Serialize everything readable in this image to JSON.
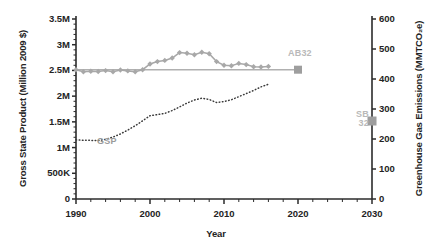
{
  "chart_data": {
    "type": "line",
    "title": "",
    "xlabel": "Year",
    "xlim": [
      1990,
      2030
    ],
    "xticks": [
      1990,
      2000,
      2010,
      2020,
      2030
    ],
    "xtick_labels": [
      "1990",
      "2000",
      "2010",
      "2020",
      "2030"
    ],
    "minor_xtick_step": 2,
    "grid": false,
    "legend_position": "inline-annotations",
    "axes": [
      {
        "id": "left",
        "ylabel": "Gross State Product (Million 2009 $)",
        "ylim": [
          0,
          3500000
        ],
        "yticks": [
          0,
          500000,
          1000000,
          1500000,
          2000000,
          2500000,
          3000000,
          3500000
        ],
        "ytick_labels": [
          "0",
          "500K",
          "1M",
          "1.5M",
          "2M",
          "2.5M",
          "3M",
          "3.5M"
        ]
      },
      {
        "id": "right",
        "ylabel": "Greenhouse Gas Emissions (MMTCO₂e)",
        "ylim": [
          0,
          600
        ],
        "yticks": [
          0,
          100,
          200,
          300,
          400,
          500,
          600
        ],
        "ytick_labels": [
          "0",
          "100",
          "200",
          "300",
          "400",
          "500",
          "600"
        ]
      }
    ],
    "series": [
      {
        "name": "GHG Emissions",
        "axis": "right",
        "style": "line-with-diamond-markers",
        "color": "#a8a8a8",
        "x": [
          1990,
          1991,
          1992,
          1993,
          1994,
          1995,
          1996,
          1997,
          1998,
          1999,
          2000,
          2001,
          2002,
          2003,
          2004,
          2005,
          2006,
          2007,
          2008,
          2009,
          2010,
          2011,
          2012,
          2013,
          2014,
          2015,
          2016
        ],
        "values": [
          431,
          424,
          426,
          425,
          428,
          424,
          430,
          427,
          424,
          431,
          450,
          458,
          462,
          470,
          488,
          486,
          481,
          489,
          484,
          458,
          446,
          444,
          452,
          448,
          441,
          440,
          442
        ]
      },
      {
        "name": "GSP",
        "axis": "left",
        "style": "dotted-line",
        "color": "#3a3a3a",
        "label": "GSP",
        "x": [
          1990,
          1991,
          1992,
          1993,
          1994,
          1995,
          1996,
          1997,
          1998,
          1999,
          2000,
          2001,
          2002,
          2003,
          2004,
          2005,
          2006,
          2007,
          2008,
          2009,
          2010,
          2011,
          2012,
          2013,
          2014,
          2015,
          2016
        ],
        "values": [
          1150000,
          1140000,
          1140000,
          1135000,
          1160000,
          1205000,
          1265000,
          1340000,
          1425000,
          1520000,
          1620000,
          1640000,
          1665000,
          1720000,
          1790000,
          1865000,
          1925000,
          1960000,
          1935000,
          1875000,
          1895000,
          1930000,
          1990000,
          2050000,
          2110000,
          2180000,
          2230000
        ]
      }
    ],
    "annotations": [
      {
        "name": "AB32",
        "label": "AB32",
        "type": "target-line-with-square-marker",
        "axis": "right",
        "value": 431,
        "x_start": 1990,
        "x_end": 2020,
        "color": "#b0b0b0"
      },
      {
        "name": "SB32",
        "label_line1": "SB",
        "label_line2": "32",
        "type": "target-square-marker",
        "axis": "right",
        "value": 260,
        "x": 2030,
        "color": "#9e9e9e"
      }
    ]
  },
  "labels": {
    "xlabel": "Year",
    "ylabel_left": "Gross State Product (Million 2009 $)",
    "ylabel_right": "Greenhouse Gas Emissions (MMTCO₂e)",
    "gsp": "GSP",
    "ab32": "AB32",
    "sb32_line1": "SB",
    "sb32_line2": "32"
  }
}
